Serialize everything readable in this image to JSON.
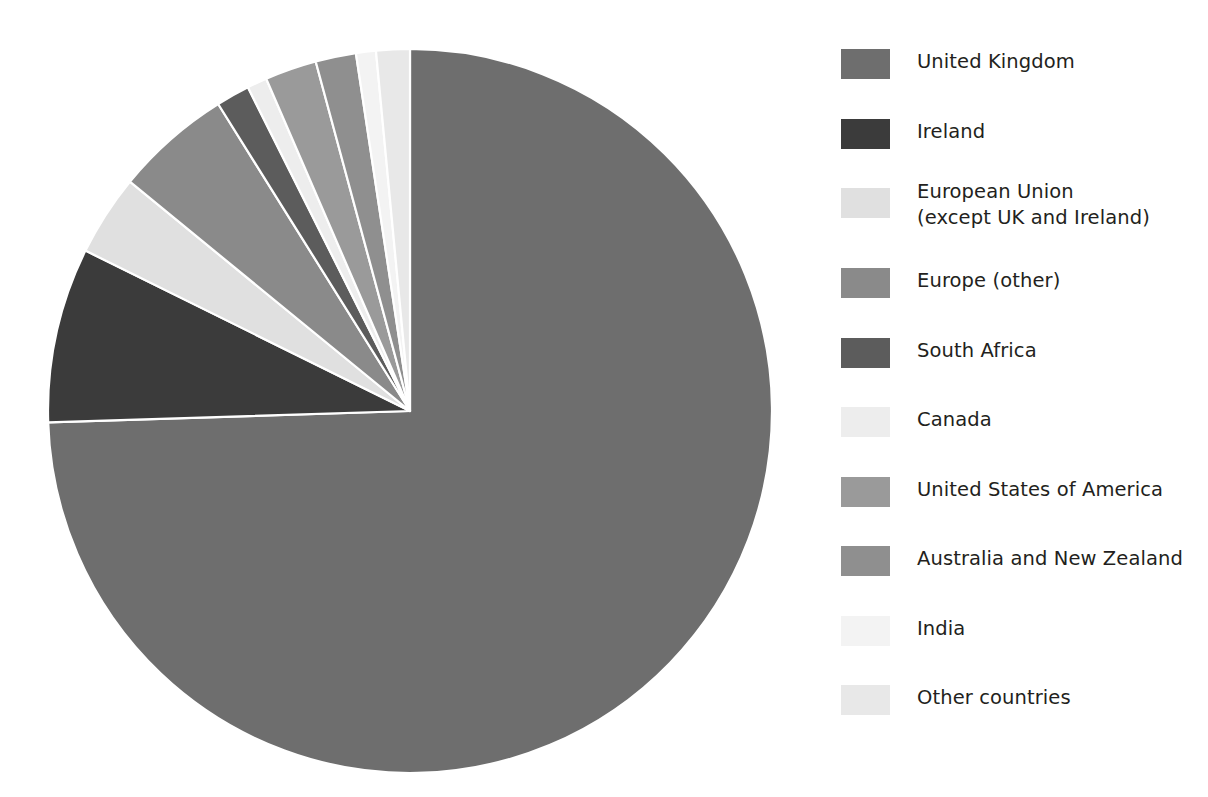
{
  "chart_data": {
    "type": "pie",
    "title": "",
    "subtitle": "",
    "xlabel": "",
    "ylabel": "",
    "legend_position": "right",
    "grid": false,
    "start_angle_deg": 0,
    "direction": "clockwise",
    "center": {
      "x": 410,
      "y": 411
    },
    "radius": 362,
    "categories": [
      "United Kingdom",
      "Ireland",
      "European Union\n(except UK and Ireland)",
      "Europe (other)",
      "South Africa",
      "Canada",
      "United States of America",
      "Australia and New Zealand",
      "India",
      "Other countries"
    ],
    "values": [
      74.5,
      7.8,
      3.6,
      5.2,
      1.5,
      0.9,
      2.3,
      1.8,
      0.9,
      1.5
    ],
    "unit": "percent",
    "colors": [
      "#6e6e6e",
      "#3b3b3b",
      "#e0e0e0",
      "#8a8a8a",
      "#5c5c5c",
      "#ededed",
      "#9a9a9a",
      "#8f8f8f",
      "#f3f3f3",
      "#e8e8e8"
    ],
    "slices": [
      {
        "label": "United Kingdom",
        "value": 74.5,
        "color": "#6e6e6e",
        "start_deg": 0.0,
        "end_deg": 268.2
      },
      {
        "label": "Ireland",
        "value": 7.8,
        "color": "#3b3b3b",
        "start_deg": 268.2,
        "end_deg": 296.3
      },
      {
        "label": "European Union (except UK and Ireland)",
        "value": 3.6,
        "color": "#e0e0e0",
        "start_deg": 296.3,
        "end_deg": 309.3
      },
      {
        "label": "Europe (other)",
        "value": 5.2,
        "color": "#8a8a8a",
        "start_deg": 309.3,
        "end_deg": 328.0
      },
      {
        "label": "South Africa",
        "value": 1.5,
        "color": "#5c5c5c",
        "start_deg": 328.0,
        "end_deg": 333.4
      },
      {
        "label": "Canada",
        "value": 0.9,
        "color": "#ededed",
        "start_deg": 333.4,
        "end_deg": 336.6
      },
      {
        "label": "United States of America",
        "value": 2.3,
        "color": "#9a9a9a",
        "start_deg": 336.6,
        "end_deg": 344.9
      },
      {
        "label": "Australia and New Zealand",
        "value": 1.8,
        "color": "#8f8f8f",
        "start_deg": 344.9,
        "end_deg": 351.4
      },
      {
        "label": "India",
        "value": 0.9,
        "color": "#f3f3f3",
        "start_deg": 351.4,
        "end_deg": 354.6
      },
      {
        "label": "Other countries",
        "value": 1.5,
        "color": "#e8e8e8",
        "start_deg": 354.6,
        "end_deg": 360.0
      }
    ]
  },
  "legend": {
    "items": [
      {
        "label": "United Kingdom",
        "color": "#6e6e6e"
      },
      {
        "label": "Ireland",
        "color": "#3b3b3b"
      },
      {
        "label": "European Union\n(except UK and Ireland)",
        "color": "#e0e0e0"
      },
      {
        "label": "Europe (other)",
        "color": "#8a8a8a"
      },
      {
        "label": "South Africa",
        "color": "#5c5c5c"
      },
      {
        "label": "Canada",
        "color": "#ededed"
      },
      {
        "label": "United States of America",
        "color": "#9a9a9a"
      },
      {
        "label": "Australia and New Zealand",
        "color": "#8f8f8f"
      },
      {
        "label": "India",
        "color": "#f3f3f3"
      },
      {
        "label": "Other countries",
        "color": "#e8e8e8"
      }
    ]
  }
}
